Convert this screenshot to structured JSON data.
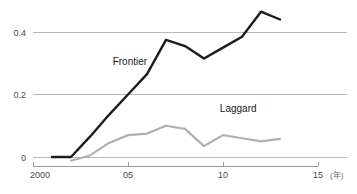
{
  "chart_data": {
    "type": "line",
    "title": "",
    "xlabel": "",
    "ylabel": "",
    "unit_note": "(年)",
    "grid": true,
    "legend_position": "inline-annotation",
    "xlim": [
      2000,
      2015
    ],
    "ylim": [
      -0.02,
      0.49
    ],
    "x_ticks": [
      2000,
      2005,
      2010,
      2015
    ],
    "x_tick_labels": [
      "2000",
      "05",
      "10",
      "15"
    ],
    "y_ticks": [
      0,
      0.2,
      0.4
    ],
    "y_tick_labels": [
      "0",
      "0.2",
      "0.4"
    ],
    "series": [
      {
        "name": "Frontier",
        "color": "#1c1c1c",
        "x": [
          2001,
          2002,
          2003,
          2004,
          2005,
          2006,
          2007,
          2008,
          2009,
          2010,
          2011,
          2012,
          2013
        ],
        "values": [
          0.0,
          0.0,
          0.065,
          0.135,
          0.2,
          0.265,
          0.375,
          0.355,
          0.315,
          0.35,
          0.385,
          0.465,
          0.44
        ]
      },
      {
        "name": "Laggard",
        "color": "#b0b0b0",
        "x": [
          2002,
          2003,
          2004,
          2005,
          2006,
          2007,
          2008,
          2009,
          2010,
          2011,
          2012,
          2013
        ],
        "values": [
          -0.012,
          0.005,
          0.045,
          0.07,
          0.075,
          0.1,
          0.09,
          0.035,
          0.07,
          0.06,
          0.05,
          0.058
        ]
      }
    ],
    "annotations": [
      {
        "text": "Frontier",
        "x": 2005.1,
        "y": 0.295
      },
      {
        "text": "Laggard",
        "x": 2010.8,
        "y": 0.145
      }
    ]
  }
}
